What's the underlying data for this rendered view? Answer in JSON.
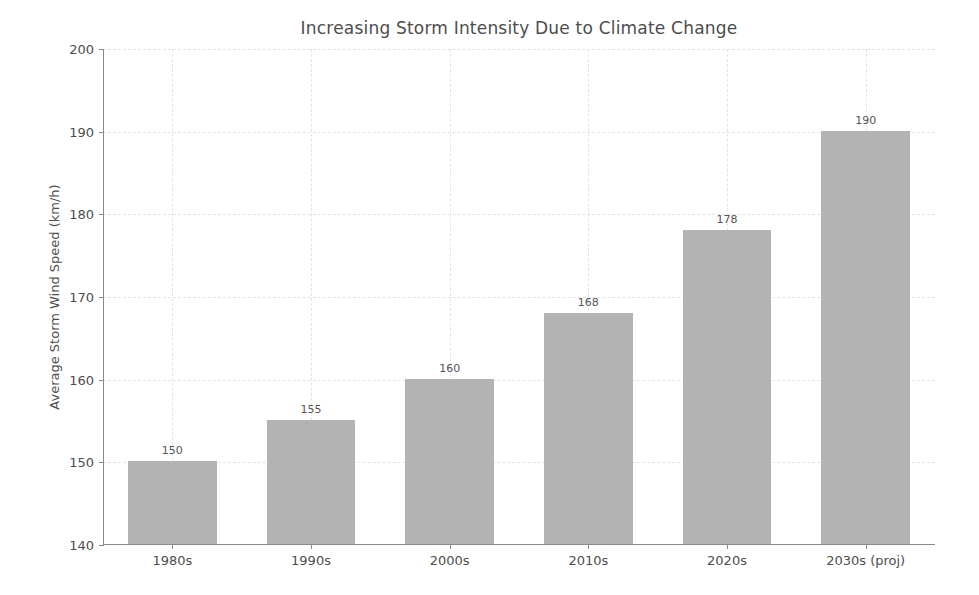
{
  "chart_data": {
    "type": "bar",
    "title": "Increasing Storm Intensity Due to Climate Change",
    "xlabel": "",
    "ylabel": "Average Storm Wind Speed (km/h)",
    "categories": [
      "1980s",
      "1990s",
      "2000s",
      "2010s",
      "2020s",
      "2030s (proj)"
    ],
    "values": [
      150,
      155,
      160,
      168,
      178,
      190
    ],
    "value_labels": [
      "150",
      "155",
      "160",
      "168",
      "178",
      "190"
    ],
    "ylim": [
      140,
      200
    ],
    "yticks": [
      140,
      150,
      160,
      170,
      180,
      190,
      200
    ],
    "ytick_labels": [
      "140",
      "150",
      "160",
      "170",
      "180",
      "190",
      "200"
    ],
    "grid": true,
    "grid_style": "dashed",
    "legend": null,
    "bar_color": "#b3b3b3",
    "grid_color": "#e4e4e4",
    "axis_color": "#8a8a8a",
    "text_color": "#4d4d4d",
    "background_color": "#ffffff"
  }
}
